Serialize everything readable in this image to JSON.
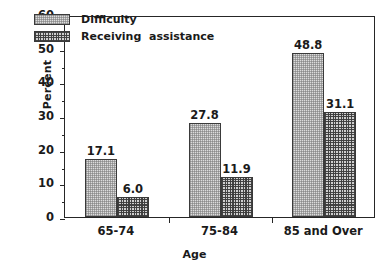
{
  "chart_data": {
    "type": "bar",
    "title": "",
    "subtitle": "",
    "xlabel": "Age",
    "ylabel": "Percent",
    "categories": [
      "65-74",
      "75-84",
      "85 and Over"
    ],
    "series": [
      {
        "name": "Difficulty",
        "values": [
          17.1,
          27.8,
          48.8
        ],
        "labels": [
          "17.1",
          "27.8",
          "48.8"
        ],
        "fill": "light-stipple",
        "color": "#dcdcdc"
      },
      {
        "name": "Receiving  assistance",
        "values": [
          6.0,
          11.9,
          31.1
        ],
        "labels": [
          "6.0",
          "11.9",
          "31.1"
        ],
        "fill": "dark-crosshatch",
        "color": "#cfcfcf"
      }
    ],
    "ylim": [
      0,
      60
    ],
    "yticks": [
      0,
      10,
      20,
      30,
      40,
      50,
      60
    ],
    "ytick_labels": [
      "0",
      "10",
      "20",
      "30",
      "40",
      "50",
      "60"
    ],
    "yminor_ticks": [
      5,
      15,
      25,
      35,
      45,
      55
    ],
    "grid": false,
    "legend_position": "upper-left-inside",
    "frame": true,
    "axis_color": "#262626"
  }
}
